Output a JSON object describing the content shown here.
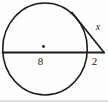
{
  "figure": {
    "type": "geometry-diagram",
    "labels": {
      "internal_chord": "8",
      "external_segment": "2",
      "tangent_segment": "x"
    },
    "colors": {
      "stroke": "#1c1c1c",
      "background": "#fefefe"
    }
  }
}
